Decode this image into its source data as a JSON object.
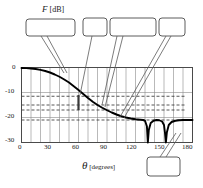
{
  "figure": {
    "y_axis_title_main": "F",
    "y_axis_title_unit": "[dB]",
    "x_axis_title_main": "θ",
    "x_axis_title_unit": "[degrees]"
  },
  "callouts": [
    {
      "id": "roll-off",
      "label": "Roll-off",
      "sub": "",
      "sub_italic": false
    },
    {
      "id": "f-plus-10",
      "label": "F",
      "sub": "+10",
      "sub_italic": false
    },
    {
      "id": "f-horizon",
      "label": "F",
      "sub": "horizon",
      "sub_italic": true
    },
    {
      "id": "f-minus-10",
      "label": "F",
      "sub": "-10",
      "sub_italic": false
    },
    {
      "id": "f-nadir",
      "label": "F",
      "sub": "nadir",
      "sub_italic": true
    }
  ],
  "chart_data": {
    "type": "line",
    "title": "",
    "xlabel": "θ [degrees]",
    "ylabel": "F [dB]",
    "xlim": [
      0,
      180
    ],
    "ylim": [
      -30,
      0
    ],
    "xticks": [
      0,
      30,
      60,
      90,
      120,
      150,
      180
    ],
    "xtick_labels": [
      "0",
      "30",
      "60",
      "90",
      "120",
      "150",
      "180"
    ],
    "yticks": [
      0,
      -10,
      -20,
      -30
    ],
    "ytick_labels": [
      "0",
      "-10",
      "-20",
      "-30"
    ],
    "grid": true,
    "grid_x_step": 10,
    "grid_y_step": 10,
    "legend": "none",
    "dashed_reference_levels": [
      -11.5,
      -15.0,
      -17.0,
      -21.0
    ],
    "marker_bar": {
      "x": 60,
      "y_top": -11.0,
      "y_bottom": -17.0
    },
    "nulls": [
      {
        "x": 133,
        "depth": -30.0
      },
      {
        "x": 152,
        "depth": -30.0
      }
    ],
    "series": [
      {
        "name": "antenna roll-off pattern",
        "x": [
          0,
          5,
          10,
          15,
          20,
          25,
          30,
          35,
          40,
          45,
          50,
          55,
          60,
          65,
          70,
          75,
          80,
          85,
          90,
          95,
          100,
          105,
          110,
          115,
          120,
          125,
          128,
          130,
          132,
          133,
          134,
          136,
          139,
          142,
          145,
          148,
          150,
          151,
          152,
          153,
          155,
          158,
          162,
          166,
          170,
          175,
          180
        ],
        "y": [
          -0.2,
          -0.25,
          -0.4,
          -0.6,
          -0.95,
          -1.4,
          -2.0,
          -2.8,
          -3.7,
          -4.8,
          -6.0,
          -7.5,
          -9.0,
          -10.6,
          -12.2,
          -13.7,
          -15.0,
          -16.1,
          -17.1,
          -18.0,
          -18.8,
          -19.5,
          -20.0,
          -20.4,
          -20.7,
          -20.9,
          -21.0,
          -21.3,
          -23.5,
          -30.0,
          -25.0,
          -22.2,
          -21.3,
          -21.0,
          -21.1,
          -21.6,
          -23.0,
          -26.0,
          -30.0,
          -26.0,
          -23.0,
          -21.8,
          -21.3,
          -21.1,
          -21.0,
          -21.0,
          -21.0
        ]
      }
    ]
  }
}
